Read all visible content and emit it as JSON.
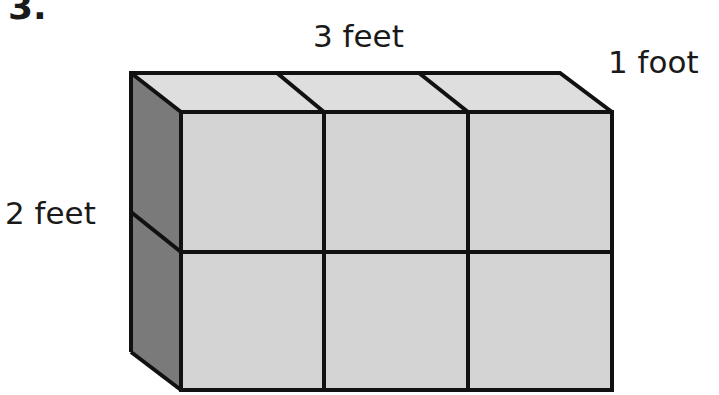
{
  "problem": {
    "number": "3.",
    "labels": {
      "width": "3 feet",
      "depth": "1 foot",
      "height": "2 feet"
    },
    "figure": {
      "type": "rectangular-prism-of-unit-cubes",
      "columns": 3,
      "rows": 2,
      "depth_layers": 1,
      "colors": {
        "front_face": "#d4d4d4",
        "top_face": "#dedede",
        "side_face": "#7a7a7a",
        "edges": "#111111"
      }
    }
  }
}
